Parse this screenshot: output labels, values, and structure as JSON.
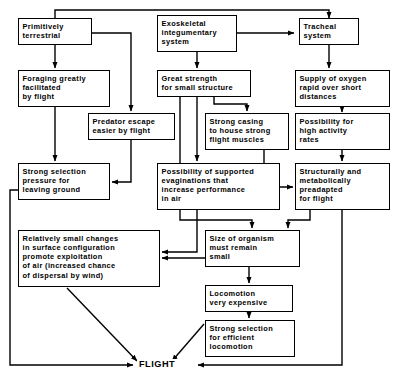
{
  "diagram": {
    "terminal_label": "FLIGHT",
    "stroke_color": "#000000",
    "background_color": "#ffffff",
    "nodes": [
      {
        "id": "primitively-terrestrial",
        "label": "Primitively\nterrestrial",
        "x": 18,
        "y": 18,
        "w": 74,
        "h": 27
      },
      {
        "id": "exoskeletal-integumentary-system",
        "label": "Exoskeletal\nintegumentary\nsystem",
        "x": 157,
        "y": 15,
        "w": 80,
        "h": 37
      },
      {
        "id": "tracheal-system",
        "label": "Tracheal\nsystem",
        "x": 299,
        "y": 18,
        "w": 60,
        "h": 27
      },
      {
        "id": "foraging-greatly-facilitated-by-flight",
        "label": "Foraging greatly\nfacilitated\nby flight",
        "x": 18,
        "y": 70,
        "w": 92,
        "h": 37
      },
      {
        "id": "great-strength-for-small-structure",
        "label": "Great strength\nfor small structure",
        "x": 157,
        "y": 70,
        "w": 94,
        "h": 27
      },
      {
        "id": "supply-of-oxygen",
        "label": "Supply of oxygen\nrapid over short\ndistances",
        "x": 295,
        "y": 70,
        "w": 95,
        "h": 37
      },
      {
        "id": "predator-escape-easier-by-flight",
        "label": "Predator escape\neasier by flight",
        "x": 88,
        "y": 113,
        "w": 87,
        "h": 27
      },
      {
        "id": "strong-casing-flight-muscles",
        "label": "Strong casing\nto house strong\nflight muscles",
        "x": 205,
        "y": 113,
        "w": 84,
        "h": 37
      },
      {
        "id": "possibility-high-activity-rates",
        "label": "Possibility for\nhigh activity\nrates",
        "x": 295,
        "y": 113,
        "w": 95,
        "h": 37
      },
      {
        "id": "strong-selection-pressure-leaving-ground",
        "label": "Strong selection\npressure for\nleaving ground",
        "x": 18,
        "y": 163,
        "w": 92,
        "h": 37
      },
      {
        "id": "possibility-supported-evaginations",
        "label": "Possibility of supported\nevaginations that\nincrease performance\nin air",
        "x": 157,
        "y": 163,
        "w": 123,
        "h": 47
      },
      {
        "id": "structurally-metabolically-preadapted",
        "label": "Structurally and\nmetabolically\npreadapted\nfor flight",
        "x": 295,
        "y": 163,
        "w": 95,
        "h": 47
      },
      {
        "id": "relatively-small-changes-surface-configuration",
        "label": "Relatively small changes\nin surface configuration\npromote exploitation\nof air  (increased chance\nof dispersal by wind)",
        "x": 18,
        "y": 230,
        "w": 142,
        "h": 57
      },
      {
        "id": "size-of-organism-must-remain-small",
        "label": "Size of organism\nmust remain\nsmall",
        "x": 205,
        "y": 230,
        "w": 95,
        "h": 37
      },
      {
        "id": "locomotion-very-expensive",
        "label": "Locomotion\nvery expensive",
        "x": 205,
        "y": 285,
        "w": 88,
        "h": 27
      },
      {
        "id": "strong-selection-efficient-locomotion",
        "label": "Strong selection\nfor efficient\nlocomotion",
        "x": 205,
        "y": 320,
        "w": 90,
        "h": 37
      }
    ],
    "edges": [
      {
        "from": "primitively-terrestrial",
        "to": "tracheal-system",
        "kind": "top-rail"
      },
      {
        "from": "exoskeletal-integumentary-system",
        "to": "tracheal-system",
        "kind": "horizontal"
      },
      {
        "from": "primitively-terrestrial",
        "to": "foraging-greatly-facilitated-by-flight",
        "kind": "vertical"
      },
      {
        "from": "primitively-terrestrial",
        "to": "predator-escape-easier-by-flight",
        "kind": "elbow"
      },
      {
        "from": "exoskeletal-integumentary-system",
        "to": "great-strength-for-small-structure",
        "kind": "vertical"
      },
      {
        "from": "tracheal-system",
        "to": "supply-of-oxygen",
        "kind": "vertical"
      },
      {
        "from": "supply-of-oxygen",
        "to": "possibility-high-activity-rates",
        "kind": "vertical"
      },
      {
        "from": "great-strength-for-small-structure",
        "to": "strong-casing-flight-muscles",
        "kind": "elbow"
      },
      {
        "from": "great-strength-for-small-structure",
        "to": "possibility-supported-evaginations",
        "kind": "vertical"
      },
      {
        "from": "great-strength-for-small-structure",
        "to": "size-of-organism-must-remain-small",
        "kind": "elbow"
      },
      {
        "from": "foraging-greatly-facilitated-by-flight",
        "to": "strong-selection-pressure-leaving-ground",
        "kind": "vertical"
      },
      {
        "from": "predator-escape-easier-by-flight",
        "to": "strong-selection-pressure-leaving-ground",
        "kind": "elbow"
      },
      {
        "from": "possibility-high-activity-rates",
        "to": "structurally-metabolically-preadapted",
        "kind": "vertical"
      },
      {
        "from": "strong-casing-flight-muscles",
        "to": "structurally-metabolically-preadapted",
        "kind": "elbow"
      },
      {
        "from": "strong-selection-pressure-leaving-ground",
        "to": "possibility-supported-evaginations",
        "kind": "elbow"
      },
      {
        "from": "possibility-supported-evaginations",
        "to": "relatively-small-changes-surface-configuration",
        "kind": "elbow"
      },
      {
        "from": "size-of-organism-must-remain-small",
        "to": "relatively-small-changes-surface-configuration",
        "kind": "horizontal"
      },
      {
        "from": "structurally-metabolically-preadapted",
        "to": "size-of-organism-must-remain-small",
        "kind": "elbow"
      },
      {
        "from": "size-of-organism-must-remain-small",
        "to": "locomotion-very-expensive",
        "kind": "vertical"
      },
      {
        "from": "locomotion-very-expensive",
        "to": "strong-selection-efficient-locomotion",
        "kind": "vertical"
      },
      {
        "from": "relatively-small-changes-surface-configuration",
        "to": "FLIGHT",
        "kind": "diagonal"
      },
      {
        "from": "strong-selection-efficient-locomotion",
        "to": "FLIGHT",
        "kind": "diagonal"
      },
      {
        "from": "strong-selection-pressure-leaving-ground",
        "to": "FLIGHT",
        "kind": "elbow"
      },
      {
        "from": "structurally-metabolically-preadapted",
        "to": "FLIGHT",
        "kind": "elbow"
      }
    ]
  }
}
